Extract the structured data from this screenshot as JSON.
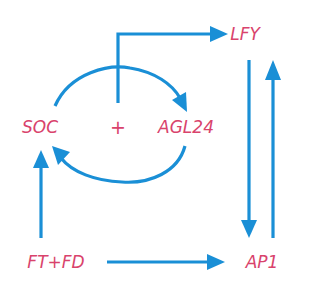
{
  "diagram": {
    "type": "gene-regulatory-network",
    "colors": {
      "node_text": "#d9436c",
      "edge": "#1a8fd6",
      "background": "#ffffff"
    },
    "nodes": {
      "lfy": "LFY",
      "soc": "SOC",
      "plus": "+",
      "agl24": "AGL24",
      "ftfd": "FT+FD",
      "ap1": "AP1"
    },
    "edges": [
      {
        "from": "SOC+AGL24",
        "to": "LFY"
      },
      {
        "from": "SOC",
        "to": "AGL24"
      },
      {
        "from": "AGL24",
        "to": "SOC"
      },
      {
        "from": "FT+FD",
        "to": "SOC"
      },
      {
        "from": "FT+FD",
        "to": "AP1"
      },
      {
        "from": "LFY",
        "to": "AP1"
      },
      {
        "from": "AP1",
        "to": "LFY"
      }
    ]
  }
}
